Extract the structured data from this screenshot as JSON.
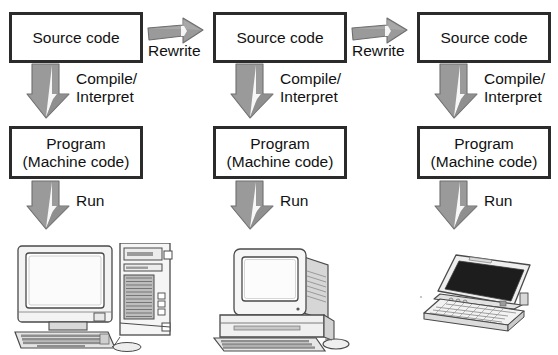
{
  "diagram": {
    "title_clipped": "",
    "columns": [
      {
        "id": "col-1",
        "source_box": {
          "line1": "Source code"
        },
        "compile_label": {
          "line1": "Compile/",
          "line2": "Interpret"
        },
        "program_box": {
          "line1": "Program",
          "line2": "(Machine code)"
        },
        "run_label": "Run",
        "device": "desktop-tower-computer"
      },
      {
        "id": "col-2",
        "source_box": {
          "line1": "Source code"
        },
        "compile_label": {
          "line1": "Compile/",
          "line2": "Interpret"
        },
        "program_box": {
          "line1": "Program",
          "line2": "(Machine code)"
        },
        "run_label": "Run",
        "device": "all-in-one-desktop-computer"
      },
      {
        "id": "col-3",
        "source_box": {
          "line1": "Source code"
        },
        "compile_label": {
          "line1": "Compile/",
          "line2": "Interpret"
        },
        "program_box": {
          "line1": "Program",
          "line2": "(Machine code)"
        },
        "run_label": "Run",
        "device": "laptop-computer"
      }
    ],
    "rewrite_arrows": [
      {
        "id": "rewrite-1",
        "label": "Rewrite"
      },
      {
        "id": "rewrite-2",
        "label": "Rewrite"
      }
    ],
    "colors": {
      "background": "#ffffff",
      "box_border": "#2b2b2b",
      "text": "#111111",
      "arrow_fill": "#9a9a9a",
      "arrow_fill_dark": "#868686",
      "arrow_edge": "#6d6d6d",
      "device_line": "#4a4a4a",
      "device_fill": "#f2f2f2",
      "screen_dark": "#1d1d1d"
    }
  }
}
